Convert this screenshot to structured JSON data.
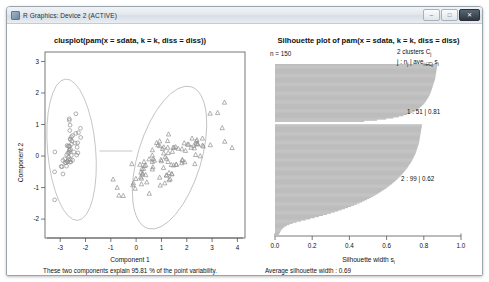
{
  "window": {
    "title": "R Graphics: Device 2 (ACTIVE)",
    "icon": "r-graphics-icon",
    "buttons": {
      "minimize": "–",
      "maximize": "□",
      "close": "✕"
    }
  },
  "chart_data": [
    {
      "type": "scatter",
      "id": "clusplot",
      "title": "clusplot(pam(x = sdata, k = k, diss = diss))",
      "xlabel": "Component 1",
      "ylabel": "Component 2",
      "xlim": [
        -3.6,
        4.3
      ],
      "ylim": [
        -2.6,
        3.3
      ],
      "xticks": [
        "-3",
        "-2",
        "-1",
        "0",
        "1",
        "2",
        "3",
        "4"
      ],
      "xtick_values": [
        -3,
        -2,
        -1,
        0,
        1,
        2,
        3,
        4
      ],
      "yticks": [
        "3",
        "2",
        "1",
        "0",
        "-1",
        "-2"
      ],
      "ytick_values": [
        3,
        2,
        1,
        0,
        -1,
        -2
      ],
      "grid": false,
      "footnote": "These two components explain 95.81 % of the point variability.",
      "series": [
        {
          "name": "cluster-1",
          "marker": "circle",
          "points": [
            [
              -2.68,
              0.32
            ],
            [
              -2.71,
              -0.18
            ],
            [
              -2.89,
              -0.14
            ],
            [
              -2.75,
              -0.32
            ],
            [
              -2.73,
              0.33
            ],
            [
              -2.28,
              0.74
            ],
            [
              -2.82,
              -0.09
            ],
            [
              -2.63,
              0.17
            ],
            [
              -2.89,
              -0.57
            ],
            [
              -2.67,
              -0.11
            ],
            [
              -2.51,
              0.65
            ],
            [
              -2.56,
              0.02
            ],
            [
              -2.77,
              -0.21
            ],
            [
              -3.22,
              -0.5
            ],
            [
              -2.64,
              1.18
            ],
            [
              -2.38,
              1.34
            ],
            [
              -2.62,
              0.81
            ],
            [
              -2.65,
              0.31
            ],
            [
              -2.2,
              0.88
            ],
            [
              -2.59,
              0.52
            ],
            [
              -2.31,
              0.42
            ],
            [
              -2.54,
              0.48
            ],
            [
              -3.21,
              0.13
            ],
            [
              -2.3,
              0.1
            ],
            [
              -2.35,
              0.03
            ],
            [
              -2.51,
              -0.13
            ],
            [
              -2.46,
              0.13
            ],
            [
              -2.56,
              0.37
            ],
            [
              -2.63,
              0.31
            ],
            [
              -2.63,
              -0.19
            ],
            [
              -2.58,
              -0.19
            ],
            [
              -2.41,
              0.41
            ],
            [
              -2.61,
              0.98
            ],
            [
              -2.64,
              1.13
            ],
            [
              -2.6,
              -0.11
            ],
            [
              -2.67,
              -0.03
            ],
            [
              -2.38,
              0.72
            ],
            [
              -2.69,
              0.1
            ],
            [
              -2.96,
              -0.33
            ],
            [
              -2.59,
              0.21
            ],
            [
              -2.64,
              0.19
            ],
            [
              -3.22,
              -1.39
            ],
            [
              -2.93,
              -0.34
            ],
            [
              -2.33,
              0.28
            ],
            [
              -2.19,
              0.59
            ],
            [
              -2.72,
              -0.17
            ],
            [
              -2.56,
              0.61
            ],
            [
              -2.81,
              -0.21
            ],
            [
              -2.61,
              0.54
            ],
            [
              -2.64,
              0.12
            ],
            [
              -2.74,
              0.04
            ]
          ]
        },
        {
          "name": "cluster-2",
          "marker": "triangle",
          "points": [
            [
              1.28,
              0.69
            ],
            [
              0.93,
              0.32
            ],
            [
              1.46,
              0.27
            ],
            [
              0.18,
              -0.67
            ],
            [
              1.09,
              0.09
            ],
            [
              0.64,
              -0.42
            ],
            [
              1.09,
              0.28
            ],
            [
              -0.75,
              -1.0
            ],
            [
              1.04,
              0.23
            ],
            [
              -0.01,
              -0.72
            ],
            [
              -0.51,
              -1.26
            ],
            [
              0.51,
              -0.1
            ],
            [
              0.26,
              -0.55
            ],
            [
              0.98,
              -0.12
            ],
            [
              -0.17,
              -0.25
            ],
            [
              0.93,
              0.47
            ],
            [
              0.66,
              -0.35
            ],
            [
              0.23,
              -0.4
            ],
            [
              0.95,
              -0.93
            ],
            [
              0.21,
              -0.71
            ],
            [
              1.15,
              -0.03
            ],
            [
              0.38,
              -0.29
            ],
            [
              1.3,
              -0.53
            ],
            [
              1.0,
              -0.16
            ],
            [
              0.64,
              0.19
            ],
            [
              0.86,
              0.35
            ],
            [
              1.25,
              0.27
            ],
            [
              1.5,
              0.27
            ],
            [
              0.67,
              -0.09
            ],
            [
              -0.04,
              -1.03
            ],
            [
              -0.11,
              -0.86
            ],
            [
              -0.13,
              -0.92
            ],
            [
              0.19,
              -0.52
            ],
            [
              1.08,
              -0.37
            ],
            [
              0.64,
              0.02
            ],
            [
              0.81,
              0.42
            ],
            [
              1.24,
              0.48
            ],
            [
              0.93,
              -0.68
            ],
            [
              0.15,
              -0.27
            ],
            [
              0.21,
              -0.89
            ],
            [
              0.42,
              -0.83
            ],
            [
              0.72,
              -0.14
            ],
            [
              0.24,
              -0.58
            ],
            [
              -0.68,
              -1.25
            ],
            [
              0.38,
              -0.6
            ],
            [
              0.31,
              -0.18
            ],
            [
              0.33,
              -0.31
            ],
            [
              0.64,
              -0.18
            ],
            [
              -0.91,
              -0.74
            ],
            [
              0.29,
              -0.4
            ],
            [
              2.53,
              0.0
            ],
            [
              1.41,
              -0.57
            ],
            [
              2.62,
              0.34
            ],
            [
              1.92,
              -0.19
            ],
            [
              2.35,
              0.04
            ],
            [
              3.4,
              0.89
            ],
            [
              0.52,
              -1.19
            ],
            [
              2.93,
              0.35
            ],
            [
              2.32,
              -0.25
            ],
            [
              2.92,
              1.35
            ],
            [
              1.66,
              0.24
            ],
            [
              1.8,
              -0.22
            ],
            [
              2.17,
              0.27
            ],
            [
              1.34,
              -0.73
            ],
            [
              1.59,
              -0.27
            ],
            [
              1.9,
              0.41
            ],
            [
              1.95,
              0.17
            ],
            [
              3.49,
              1.7
            ],
            [
              3.79,
              0.26
            ],
            [
              1.3,
              -0.76
            ],
            [
              2.43,
              0.38
            ],
            [
              1.2,
              -0.61
            ],
            [
              3.5,
              0.46
            ],
            [
              1.39,
              -0.28
            ],
            [
              2.28,
              0.33
            ],
            [
              2.62,
              0.56
            ],
            [
              1.26,
              -0.18
            ],
            [
              1.2,
              -0.08
            ],
            [
              1.82,
              -0.12
            ],
            [
              2.43,
              0.38
            ],
            [
              2.65,
              0.31
            ],
            [
              3.22,
              1.37
            ],
            [
              1.83,
              -0.14
            ],
            [
              1.41,
              -0.57
            ],
            [
              1.13,
              -0.86
            ],
            [
              2.21,
              0.56
            ],
            [
              1.43,
              0.14
            ],
            [
              1.58,
              -0.27
            ],
            [
              1.27,
              0.1
            ],
            [
              2.38,
              0.4
            ],
            [
              2.3,
              0.25
            ],
            [
              2.07,
              0.37
            ],
            [
              1.2,
              -0.61
            ],
            [
              2.38,
              0.47
            ],
            [
              2.4,
              0.51
            ],
            [
              2.03,
              0.37
            ],
            [
              1.48,
              -0.29
            ],
            [
              1.81,
              0.22
            ],
            [
              1.56,
              0.29
            ]
          ]
        }
      ],
      "ellipses": [
        {
          "cx": -2.55,
          "cy": 0.2,
          "rx": 0.95,
          "ry": 2.25,
          "rot": -5
        },
        {
          "cx": 1.32,
          "cy": -0.05,
          "rx": 1.25,
          "ry": 2.35,
          "rot": 17
        }
      ]
    },
    {
      "type": "bar",
      "id": "silhouette",
      "title": "Silhouette plot of pam(x = sdata, k = k, diss = diss)",
      "n_label": "n = 150",
      "clusters_label": "2 clusters  C",
      "clusters_sub": "j",
      "legend_line": "j :  n",
      "legend_sub1": "j",
      "legend_mid": " | ave",
      "legend_sub2": "i∈Cj",
      "legend_end": "  s",
      "legend_sub3": "i",
      "xlabel": "Silhouette width s",
      "xlabel_sub": "i",
      "xlim": [
        0,
        1
      ],
      "xticks": [
        "0.0",
        "0.2",
        "0.4",
        "0.6",
        "0.8",
        "1.0"
      ],
      "xtick_values": [
        0.0,
        0.2,
        0.4,
        0.6,
        0.8,
        1.0
      ],
      "footnote": "Average silhouette width :  0.69",
      "average_silhouette_width": 0.69,
      "grid": false,
      "clusters": [
        {
          "id": "1",
          "label": "1 :  51  |  0.81",
          "size": 51,
          "ave_width": 0.81,
          "values": [
            0.873,
            0.872,
            0.871,
            0.87,
            0.869,
            0.868,
            0.867,
            0.866,
            0.865,
            0.864,
            0.863,
            0.862,
            0.861,
            0.86,
            0.858,
            0.856,
            0.854,
            0.852,
            0.85,
            0.848,
            0.846,
            0.844,
            0.842,
            0.84,
            0.838,
            0.836,
            0.833,
            0.83,
            0.827,
            0.824,
            0.82,
            0.816,
            0.812,
            0.808,
            0.803,
            0.798,
            0.792,
            0.786,
            0.779,
            0.771,
            0.762,
            0.752,
            0.74,
            0.726,
            0.71,
            0.69,
            0.666,
            0.636,
            0.598,
            0.548,
            0.48
          ]
        },
        {
          "id": "2",
          "label": "2 :  99  |  0.62",
          "size": 99,
          "ave_width": 0.62,
          "values": [
            0.79,
            0.789,
            0.788,
            0.787,
            0.786,
            0.785,
            0.784,
            0.783,
            0.782,
            0.781,
            0.78,
            0.779,
            0.778,
            0.777,
            0.776,
            0.775,
            0.774,
            0.772,
            0.77,
            0.768,
            0.766,
            0.764,
            0.762,
            0.76,
            0.758,
            0.756,
            0.753,
            0.75,
            0.747,
            0.744,
            0.741,
            0.738,
            0.735,
            0.731,
            0.727,
            0.723,
            0.719,
            0.715,
            0.711,
            0.706,
            0.701,
            0.696,
            0.691,
            0.686,
            0.681,
            0.675,
            0.669,
            0.663,
            0.657,
            0.65,
            0.643,
            0.636,
            0.629,
            0.621,
            0.613,
            0.605,
            0.597,
            0.588,
            0.579,
            0.57,
            0.56,
            0.55,
            0.54,
            0.529,
            0.518,
            0.506,
            0.494,
            0.481,
            0.468,
            0.454,
            0.44,
            0.425,
            0.409,
            0.393,
            0.376,
            0.358,
            0.34,
            0.321,
            0.301,
            0.28,
            0.258,
            0.236,
            0.213,
            0.189,
            0.165,
            0.14,
            0.116,
            0.095,
            0.078,
            0.064,
            0.053,
            0.045,
            0.039,
            0.034,
            0.03,
            0.027,
            0.024,
            0.021,
            0.018
          ]
        }
      ]
    }
  ]
}
